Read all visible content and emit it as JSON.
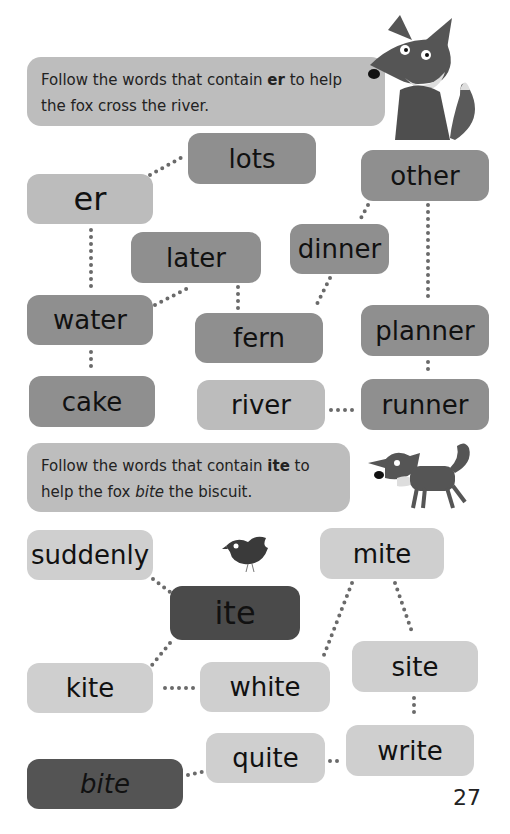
{
  "section1": {
    "instruction_prefix": "Follow the words that contain ",
    "instruction_key": "er",
    "instruction_suffix": " to help the fox cross the river.",
    "illustration": "sitting-fox",
    "words": [
      {
        "id": "er",
        "label": "er",
        "role": "start"
      },
      {
        "id": "lots",
        "label": "lots"
      },
      {
        "id": "other",
        "label": "other"
      },
      {
        "id": "later",
        "label": "later"
      },
      {
        "id": "dinner",
        "label": "dinner"
      },
      {
        "id": "water",
        "label": "water"
      },
      {
        "id": "fern",
        "label": "fern"
      },
      {
        "id": "planner",
        "label": "planner"
      },
      {
        "id": "cake",
        "label": "cake"
      },
      {
        "id": "river",
        "label": "river",
        "role": "end"
      },
      {
        "id": "runner",
        "label": "runner"
      }
    ]
  },
  "section2": {
    "instruction_prefix": "Follow the words that contain ",
    "instruction_key": "ite",
    "instruction_mid": " to help the fox ",
    "instruction_key2": "bite",
    "instruction_suffix": " the biscuit.",
    "illustration": "walking-fox",
    "bird": "bird-illustration",
    "words": [
      {
        "id": "suddenly",
        "label": "suddenly"
      },
      {
        "id": "mite",
        "label": "mite"
      },
      {
        "id": "ite",
        "label": "ite",
        "role": "start"
      },
      {
        "id": "site",
        "label": "site"
      },
      {
        "id": "kite",
        "label": "kite"
      },
      {
        "id": "white",
        "label": "white"
      },
      {
        "id": "quite",
        "label": "quite"
      },
      {
        "id": "write",
        "label": "write"
      },
      {
        "id": "bite",
        "label": "bite",
        "role": "end"
      }
    ]
  },
  "page_number": "27",
  "colors": {
    "banner": "#bdbdbd",
    "box_mid": "#8f8f8f",
    "box_light": "#bcbcbc",
    "box_pale": "#cfcfcf",
    "box_dark": "#4a4a4a",
    "dots": "#666666"
  }
}
